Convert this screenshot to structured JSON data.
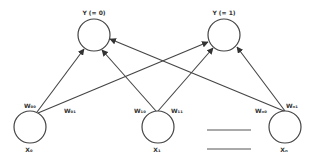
{
  "diagram": {
    "type": "neural-network",
    "output_nodes": [
      {
        "id": "y0",
        "label": "Y (= 0)",
        "cx": 94,
        "cy": 35
      },
      {
        "id": "y1",
        "label": "Y (= 1)",
        "cx": 224,
        "cy": 35
      }
    ],
    "input_nodes": [
      {
        "id": "x0",
        "label": "X₀",
        "cx": 30,
        "cy": 127
      },
      {
        "id": "x1",
        "label": "X₁",
        "cx": 158,
        "cy": 127
      },
      {
        "id": "xn",
        "label": "Xₙ",
        "cx": 285,
        "cy": 127
      }
    ],
    "weights": [
      {
        "label": "W₀₀",
        "from": "x0",
        "to": "y0"
      },
      {
        "label": "W₀₁",
        "from": "x0",
        "to": "y1"
      },
      {
        "label": "W₁₀",
        "from": "x1",
        "to": "y0"
      },
      {
        "label": "W₁₁",
        "from": "x1",
        "to": "y1"
      },
      {
        "label": "Wₙ₀",
        "from": "xn",
        "to": "y0"
      },
      {
        "label": "Wₙ₁",
        "from": "xn",
        "to": "y1"
      }
    ],
    "stroke_color": "#444444",
    "background": "#ffffff"
  }
}
